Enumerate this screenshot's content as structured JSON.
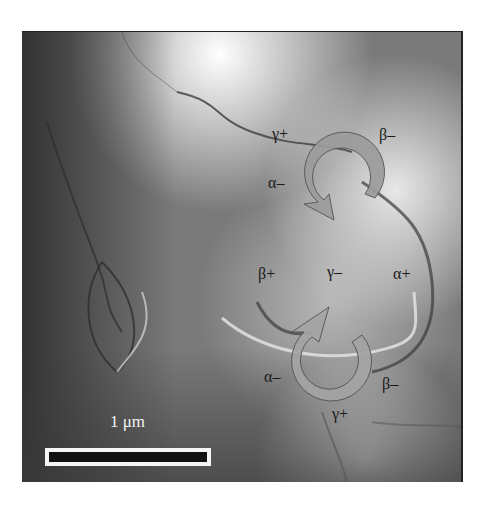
{
  "figure": {
    "type": "microscopy image of ferroelectric domain vortex pair",
    "background_color": "#ffffff",
    "arrow_color": "#9a9a9a",
    "arrow_outline": "#555555"
  },
  "labels": {
    "top_vortex": {
      "gamma_plus": "γ+",
      "beta_minus": "β–",
      "alpha_minus": "α–"
    },
    "middle": {
      "beta_plus": "β+",
      "gamma_minus": "γ–",
      "alpha_plus": "α+"
    },
    "bottom_vortex": {
      "alpha_minus": "α–",
      "beta_minus": "β–",
      "gamma_plus": "γ+"
    }
  },
  "scale_bar": {
    "label": "1 μm"
  },
  "icons": {
    "top_arrow": "circular-arrow-clockwise-icon",
    "bottom_arrow": "circular-arrow-clockwise-icon"
  }
}
